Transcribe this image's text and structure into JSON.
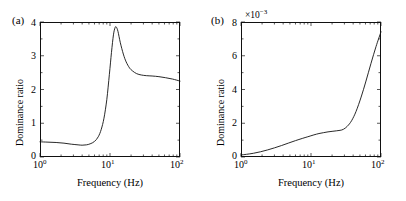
{
  "figure": {
    "background": "#ffffff",
    "line_color": "#111111",
    "panels": [
      {
        "tag": "(a)",
        "xlabel": "Frequency (Hz)",
        "ylabel": "Dominance ratio",
        "y_multiplier": "",
        "xticks": [
          "10",
          "10",
          "10"
        ],
        "xtick_exponents": [
          "0",
          "1",
          "2"
        ],
        "yticks": [
          "0",
          "1",
          "2",
          "3",
          "4"
        ]
      },
      {
        "tag": "(b)",
        "xlabel": "Frequency (Hz)",
        "ylabel": "Dominance ratio",
        "y_multiplier_base": "×10",
        "y_multiplier_exp": "−3",
        "xticks": [
          "10",
          "10",
          "10"
        ],
        "xtick_exponents": [
          "0",
          "1",
          "2"
        ],
        "yticks": [
          "0",
          "2",
          "4",
          "6",
          "8"
        ]
      }
    ]
  },
  "chart_data": [
    {
      "type": "line",
      "panel": "(a)",
      "title": "",
      "xlabel": "Frequency (Hz)",
      "ylabel": "Dominance ratio",
      "xscale": "log",
      "yscale": "linear",
      "xlim": [
        1,
        100
      ],
      "ylim": [
        0,
        4
      ],
      "yticks": [
        0,
        1,
        2,
        3,
        4
      ],
      "xticks": [
        1,
        10,
        100
      ],
      "grid": false,
      "legend": null,
      "y_multiplier": 1,
      "series": [
        {
          "name": "dominance ratio",
          "x": [
            1.0,
            1.3,
            1.7,
            2.2,
            2.8,
            3.5,
            4.0,
            4.6,
            5.2,
            6.0,
            6.8,
            7.5,
            8.2,
            9.0,
            9.8,
            10.5,
            11.2,
            11.8,
            12.3,
            13.0,
            14.0,
            15.5,
            17.0,
            19.0,
            21.0,
            24.0,
            28.0,
            33.0,
            40.0,
            50.0,
            62.0,
            78.0,
            100.0
          ],
          "y": [
            0.45,
            0.44,
            0.43,
            0.41,
            0.38,
            0.36,
            0.35,
            0.36,
            0.39,
            0.46,
            0.6,
            0.82,
            1.15,
            1.7,
            2.45,
            3.1,
            3.62,
            3.83,
            3.85,
            3.72,
            3.4,
            3.05,
            2.82,
            2.64,
            2.55,
            2.47,
            2.43,
            2.41,
            2.4,
            2.38,
            2.35,
            2.31,
            2.25
          ]
        }
      ]
    },
    {
      "type": "line",
      "panel": "(b)",
      "title": "",
      "xlabel": "Frequency (Hz)",
      "ylabel": "Dominance ratio",
      "xscale": "log",
      "yscale": "linear",
      "xlim": [
        1,
        100
      ],
      "ylim": [
        0,
        8
      ],
      "yticks": [
        0,
        2,
        4,
        6,
        8
      ],
      "xticks": [
        1,
        10,
        100
      ],
      "grid": false,
      "legend": null,
      "y_multiplier": 0.001,
      "series": [
        {
          "name": "dominance ratio",
          "x": [
            1.0,
            1.2,
            1.5,
            1.9,
            2.4,
            3.0,
            3.8,
            4.8,
            6.0,
            7.5,
            9.0,
            11.0,
            13.0,
            15.0,
            17.5,
            20.0,
            23.0,
            26.0,
            29.0,
            33.0,
            38.0,
            44.0,
            52.0,
            61.0,
            72.0,
            85.0,
            100.0
          ],
          "y": [
            0.12,
            0.16,
            0.22,
            0.31,
            0.42,
            0.54,
            0.68,
            0.83,
            0.97,
            1.1,
            1.2,
            1.31,
            1.39,
            1.44,
            1.49,
            1.52,
            1.55,
            1.58,
            1.64,
            1.82,
            2.15,
            2.7,
            3.55,
            4.5,
            5.55,
            6.55,
            7.42
          ]
        }
      ]
    }
  ]
}
